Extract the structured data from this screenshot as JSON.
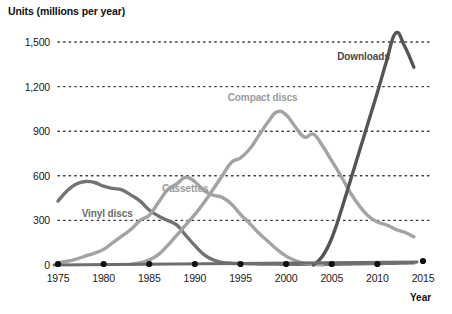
{
  "chart_data": {
    "type": "line",
    "title": "",
    "ylabel": "Units (millions per year)",
    "xlabel": "Year",
    "xlim": [
      1975,
      2015
    ],
    "ylim": [
      0,
      1620
    ],
    "yticks": [
      "0",
      "300",
      "600",
      "900",
      "1,200",
      "1,500"
    ],
    "ytick_values": [
      0,
      300,
      600,
      900,
      1200,
      1500
    ],
    "xticks": [
      "1975",
      "1980",
      "1985",
      "1990",
      "1995",
      "2000",
      "2005",
      "2010",
      "2015"
    ],
    "xtick_values": [
      1975,
      1980,
      1985,
      1990,
      1995,
      2000,
      2005,
      2010,
      2015
    ],
    "grid": "horizontal-dotted",
    "legend": "inline-labels",
    "series": [
      {
        "name": "Vinyl discs",
        "color": "#737373",
        "label_x": 1977.6,
        "label_y": 345,
        "x": [
          1975,
          1976,
          1977,
          1978,
          1979,
          1980,
          1981,
          1982,
          1983,
          1984,
          1985,
          1986,
          1987,
          1988,
          1989,
          1990,
          1991,
          1992,
          1993,
          1994,
          1995,
          1996,
          1997,
          1998,
          1999,
          2000,
          2001,
          2002,
          2003,
          2004,
          2005,
          2006,
          2007,
          2008,
          2009,
          2010,
          2011,
          2012,
          2013,
          2014
        ],
        "values": [
          430,
          500,
          545,
          562,
          555,
          530,
          515,
          505,
          470,
          430,
          370,
          330,
          300,
          270,
          200,
          130,
          70,
          35,
          18,
          12,
          10,
          8,
          7,
          6,
          6,
          5,
          5,
          5,
          5,
          5,
          5,
          6,
          7,
          8,
          9,
          10,
          11,
          12,
          13,
          14
        ]
      },
      {
        "name": "Cassettes",
        "color": "#a3a3a3",
        "label_x": 1986.4,
        "label_y": 510,
        "x": [
          1975,
          1976,
          1977,
          1978,
          1979,
          1980,
          1981,
          1982,
          1983,
          1984,
          1985,
          1986,
          1987,
          1988,
          1989,
          1990,
          1991,
          1992,
          1993,
          1994,
          1995,
          1996,
          1997,
          1998,
          1999,
          2000,
          2001,
          2002,
          2003,
          2004
        ],
        "values": [
          15,
          25,
          40,
          60,
          80,
          105,
          150,
          195,
          240,
          300,
          335,
          420,
          505,
          545,
          590,
          560,
          500,
          470,
          455,
          410,
          340,
          280,
          215,
          160,
          105,
          60,
          30,
          12,
          4,
          0
        ]
      },
      {
        "name": "Compact discs",
        "color": "#a3a3a3",
        "label_x": 1993.6,
        "label_y": 1120,
        "x": [
          1983,
          1984,
          1985,
          1986,
          1987,
          1988,
          1989,
          1990,
          1991,
          1992,
          1993,
          1994,
          1995,
          1996,
          1997,
          1998,
          1999,
          2000,
          2001,
          2002,
          2003,
          2004,
          2005,
          2006,
          2007,
          2008,
          2009,
          2010,
          2011,
          2012,
          2013,
          2014
        ],
        "values": [
          5,
          15,
          35,
          70,
          130,
          200,
          270,
          340,
          420,
          510,
          600,
          690,
          720,
          780,
          870,
          960,
          1030,
          1010,
          930,
          860,
          880,
          800,
          700,
          600,
          490,
          400,
          330,
          290,
          270,
          240,
          220,
          190
        ]
      },
      {
        "name": "Downloads",
        "color": "#555555",
        "label_x": 2005.6,
        "label_y": 1400,
        "x": [
          2003,
          2004,
          2005,
          2006,
          2007,
          2008,
          2009,
          2010,
          2011,
          2012,
          2013,
          2014
        ],
        "values": [
          0,
          60,
          180,
          360,
          560,
          760,
          960,
          1160,
          1370,
          1560,
          1470,
          1330
        ]
      }
    ]
  }
}
